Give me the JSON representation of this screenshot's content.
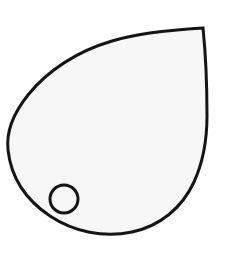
{
  "image": {
    "kind": "line-drawing",
    "subject": "teardrop-leaf-outline-with-hole",
    "width": 229,
    "height": 265,
    "background_color": "#ffffff",
    "title_text": ""
  },
  "shapes": {
    "outline": {
      "name": "teardrop-outline",
      "fill_color": "#f7f7f7",
      "stroke_color": "#151515",
      "stroke_width": 3,
      "apex_point": [
        203,
        28
      ],
      "leftmost_point": [
        8,
        137
      ],
      "rightmost_point": [
        207,
        118
      ],
      "bottom_point": [
        108,
        236
      ],
      "path": "M 203 28 C 170 30 138 33 112 41 C 78 51 48 70 28 95 C 12 115 6 132 8 150 C 11 177 26 200 50 216 C 74 232 104 238 132 232 C 160 226 182 208 194 182 C 204 160 207 138 207 116 C 207 88 206 57 203 28 Z"
    },
    "hole": {
      "name": "hole-circle",
      "fill_color": "#f7f7f7",
      "stroke_color": "#151515",
      "stroke_width": 3,
      "center": [
        64,
        199
      ],
      "radius": 14
    }
  },
  "labels": {
    "none": ""
  }
}
